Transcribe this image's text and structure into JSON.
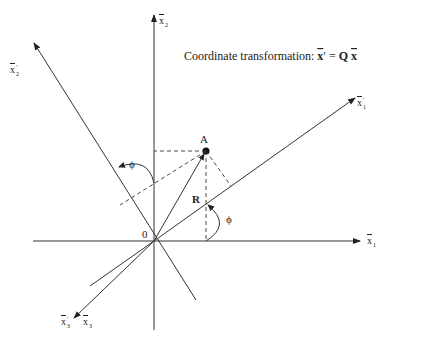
{
  "diagram": {
    "title_prefix": "Coordinate transformation: ",
    "title_lhs": "x",
    "title_prime": "′",
    "title_eq": " = ",
    "title_Q": "Q",
    "title_rhs": "x",
    "origin_label": "0",
    "point_label": "A",
    "vector_label": "R",
    "angle_label_1": "ϕ",
    "angle_label_2": "ϕ",
    "axes": {
      "x1": {
        "base": "x",
        "sub": "1",
        "prime": ""
      },
      "x2": {
        "base": "x",
        "sub": "2",
        "prime": ""
      },
      "x3": {
        "base": "x",
        "sub": "3",
        "prime": ""
      },
      "x1p": {
        "base": "x",
        "sub": "1",
        "prime": "′"
      },
      "x2p": {
        "base": "x",
        "sub": "2",
        "prime": "′"
      },
      "x3p": {
        "base": "x",
        "sub": "3",
        "prime": "′"
      }
    },
    "colors": {
      "line": "#333333",
      "text": "#222222",
      "background": "#ffffff"
    }
  }
}
